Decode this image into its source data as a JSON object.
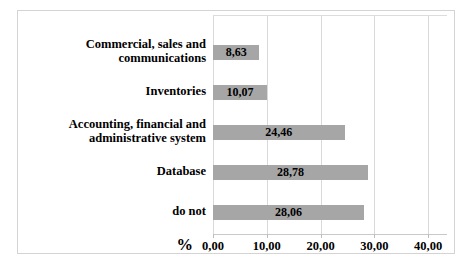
{
  "chart_data": {
    "type": "bar",
    "orientation": "horizontal",
    "title": "",
    "xlabel": "%",
    "ylabel": "",
    "categories": [
      "Commercial, sales and communications",
      "Inventories",
      "Accounting, financial and administrative system",
      "Database",
      "do not"
    ],
    "values": [
      8.63,
      10.07,
      24.46,
      28.78,
      28.06
    ],
    "value_labels": [
      "8,63",
      "10,07",
      "24,46",
      "28,78",
      "28,06"
    ],
    "xlim": [
      0,
      43.5
    ],
    "xtick_values": [
      0,
      10,
      20,
      30,
      40
    ],
    "xtick_labels": [
      "0,00",
      "10,00",
      "20,00",
      "30,00",
      "40,00"
    ],
    "grid": "vertical",
    "legend": "none",
    "colors": {
      "bar": "#a6a6a6",
      "gridline": "#d9d9d9",
      "frame_border": "#d4d4d4",
      "text": "#000000",
      "background": "#ffffff"
    }
  }
}
